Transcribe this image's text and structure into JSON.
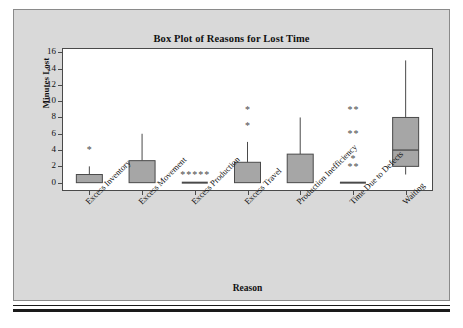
{
  "figure": {
    "background_color": "#ffffff",
    "panel_color": "#d9d9d9",
    "panel_border_color": "#8a8a8a",
    "plot_background_color": "#ffffff",
    "box_fill_color": "#a6a6a6",
    "box_line_color": "#4a4a4a",
    "rule_color": "#1a1a1a"
  },
  "chart_data": {
    "type": "box",
    "title": "Box Plot of Reasons for Lost Time",
    "xlabel": "Reason",
    "ylabel": "Minutes Lost",
    "ylim": [
      -0.9,
      16.4
    ],
    "yticks": [
      0,
      2,
      4,
      6,
      8,
      10,
      12,
      14,
      16
    ],
    "ytick_labels": [
      "0",
      "2",
      "4",
      "6",
      "8",
      "10",
      "12",
      "14",
      "16"
    ],
    "grid": false,
    "legend": null,
    "categories": [
      "Excess Inventory",
      "Excess Movement",
      "Excess Production",
      "Excess Travel",
      "Production Inefficiency",
      "Time Due to Defects",
      "Waiting"
    ],
    "boxes": [
      {
        "category": "Excess Inventory",
        "whisker_low": 0,
        "q1": 0,
        "median": 0,
        "q3": 1,
        "whisker_high": 2,
        "outliers": [
          4
        ]
      },
      {
        "category": "Excess Movement",
        "whisker_low": 0,
        "q1": 0,
        "median": 0,
        "q3": 2.7,
        "whisker_high": 6,
        "outliers": []
      },
      {
        "category": "Excess Production",
        "whisker_low": 0,
        "q1": 0,
        "median": 0,
        "q3": 0,
        "whisker_high": 0,
        "outliers": [
          1,
          1,
          1,
          1,
          1
        ]
      },
      {
        "category": "Excess Travel",
        "whisker_low": 0,
        "q1": 0,
        "median": 0,
        "q3": 2.5,
        "whisker_high": 5,
        "outliers": [
          7,
          9
        ]
      },
      {
        "category": "Production Inefficiency",
        "whisker_low": 0,
        "q1": 0,
        "median": 0,
        "q3": 3.5,
        "whisker_high": 8,
        "outliers": []
      },
      {
        "category": "Time Due to Defects",
        "whisker_low": 0,
        "q1": 0,
        "median": 0,
        "q3": 0,
        "whisker_high": 0,
        "outliers": [
          2,
          2,
          3,
          6,
          6,
          9,
          9
        ]
      },
      {
        "category": "Waiting",
        "whisker_low": 1,
        "q1": 2,
        "median": 4,
        "q3": 8,
        "whisker_high": 15,
        "outliers": []
      }
    ]
  }
}
